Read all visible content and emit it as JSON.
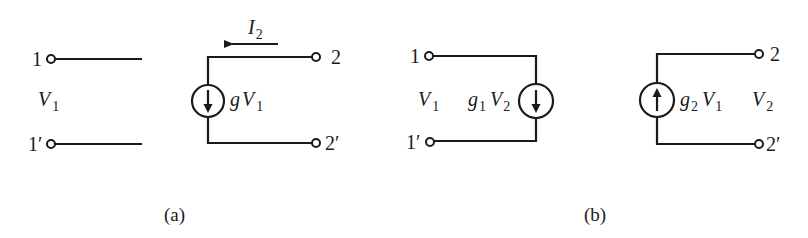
{
  "figure": {
    "panel_a": {
      "caption": "(a)",
      "terminals": {
        "t1": "1",
        "t1p": "1′",
        "t2": "2",
        "t2p": "2′"
      },
      "port1_voltage": {
        "base": "V",
        "sub": "1"
      },
      "current_label": {
        "base": "I",
        "sub": "2"
      },
      "source": {
        "prefix": "g",
        "base": "V",
        "sub": "1",
        "direction": "down"
      }
    },
    "panel_b": {
      "caption": "(b)",
      "terminals": {
        "t1": "1",
        "t1p": "1′",
        "t2": "2",
        "t2p": "2′"
      },
      "port1_voltage": {
        "base": "V",
        "sub": "1"
      },
      "port2_voltage": {
        "base": "V",
        "sub": "2"
      },
      "source_left": {
        "prefix": "g",
        "prefix_sub": "1",
        "base": "V",
        "sub": "2",
        "direction": "down"
      },
      "source_right": {
        "prefix": "g",
        "prefix_sub": "2",
        "base": "V",
        "sub": "1",
        "direction": "up"
      }
    }
  }
}
